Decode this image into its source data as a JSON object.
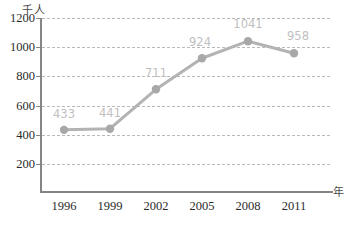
{
  "chart_data": {
    "type": "line",
    "title": "",
    "xlabel": "年",
    "ylabel": "千人",
    "categories": [
      "1996",
      "1999",
      "2002",
      "2005",
      "2008",
      "2011"
    ],
    "values": [
      433,
      441,
      711,
      924,
      1041,
      958
    ],
    "series": [
      {
        "name": "",
        "values": [
          433,
          441,
          711,
          924,
          1041,
          958
        ]
      }
    ],
    "point_labels": [
      "433",
      "441",
      "711",
      "924",
      "1041",
      "958"
    ],
    "ylim": [
      0,
      1200
    ],
    "yticks": [
      200,
      400,
      600,
      800,
      1000,
      1200
    ],
    "ytick_labels": [
      "200",
      "400",
      "600",
      "800",
      "1000",
      "1200"
    ],
    "grid": true,
    "grid_style": "dashed-horizontal",
    "legend": "none",
    "colors": {
      "line": "#b3b3b3",
      "marker": "#a8a8a8",
      "grid": "#b9b9b9",
      "axis": "#858585",
      "tick_text": "#2b2b2b",
      "data_label": "#bfbfbf",
      "background": "#ffffff"
    }
  }
}
